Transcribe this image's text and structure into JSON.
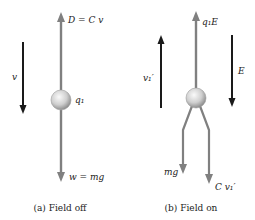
{
  "panels": [
    {
      "caption": "(a) Field off",
      "labels": {
        "drag": "D = C v",
        "charge": "q₁",
        "weight": "w = mg",
        "velocity": "v"
      }
    },
    {
      "caption": "(b) Field on",
      "labels": {
        "electric_force": "q₁E",
        "charge": "",
        "velocity": "v₁′",
        "field": "E",
        "weight": "mg",
        "drag": "C v₁′"
      }
    }
  ],
  "colors": {
    "force_arrow": "#7f7f7f",
    "motion_arrow": "#1a1a1a",
    "sphere_light": "#f2f2f2",
    "sphere_dark": "#9a9a9a"
  }
}
